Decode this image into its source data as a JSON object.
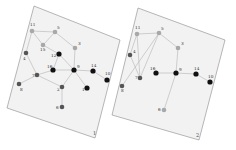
{
  "colors": {
    "black": "#111111",
    "dark": "#555555",
    "mid": "#777777",
    "light": "#a8a8a8"
  },
  "panels": [
    {
      "id": "panel-1",
      "label": "1",
      "corners": "34,6 120,40 95,138 7,108",
      "label_pos": [
        93,
        135
      ],
      "nodes": [
        {
          "id": "11",
          "x": 32,
          "y": 31,
          "shade": "light",
          "lx": 30,
          "ly": 26
        },
        {
          "id": "5",
          "x": 55,
          "y": 32,
          "shade": "light",
          "lx": 57,
          "ly": 29
        },
        {
          "id": "15",
          "x": 43,
          "y": 45,
          "shade": "light",
          "lx": 40,
          "ly": 51
        },
        {
          "id": "4",
          "x": 26,
          "y": 53,
          "shade": "dark",
          "lx": 23,
          "ly": 60
        },
        {
          "id": "3",
          "x": 75,
          "y": 48,
          "shade": "light",
          "lx": 78,
          "ly": 45
        },
        {
          "id": "12",
          "x": 59,
          "y": 54,
          "shade": "black",
          "lx": 51,
          "ly": 57
        },
        {
          "id": "16",
          "x": 53,
          "y": 70,
          "shade": "black",
          "lx": 47,
          "ly": 68
        },
        {
          "id": "9",
          "x": 74,
          "y": 70,
          "shade": "black",
          "lx": 77,
          "ly": 68
        },
        {
          "id": "14",
          "x": 93,
          "y": 71,
          "shade": "black",
          "lx": 91,
          "ly": 67
        },
        {
          "id": "10",
          "x": 107,
          "y": 80,
          "shade": "black",
          "lx": 105,
          "ly": 75
        },
        {
          "id": "7",
          "x": 37,
          "y": 75,
          "shade": "dark",
          "lx": 32,
          "ly": 77
        },
        {
          "id": "8",
          "x": 19,
          "y": 84,
          "shade": "dark",
          "lx": 20,
          "ly": 91
        },
        {
          "id": "2",
          "x": 62,
          "y": 87,
          "shade": "dark",
          "lx": 57,
          "ly": 91
        },
        {
          "id": "1",
          "x": 87,
          "y": 88,
          "shade": "black",
          "lx": 82,
          "ly": 91
        },
        {
          "id": "6",
          "x": 62,
          "y": 107,
          "shade": "dark",
          "lx": 56,
          "ly": 109
        }
      ],
      "edges": [
        [
          "11",
          "5"
        ],
        [
          "11",
          "15"
        ],
        [
          "5",
          "15"
        ],
        [
          "5",
          "3"
        ],
        [
          "11",
          "4"
        ],
        [
          "15",
          "12"
        ],
        [
          "3",
          "9"
        ],
        [
          "4",
          "7"
        ],
        [
          "12",
          "16"
        ],
        [
          "12",
          "9"
        ],
        [
          "16",
          "9"
        ],
        [
          "16",
          "7"
        ],
        [
          "9",
          "14"
        ],
        [
          "14",
          "10"
        ],
        [
          "9",
          "1"
        ],
        [
          "9",
          "2"
        ],
        [
          "7",
          "2"
        ],
        [
          "8",
          "7"
        ],
        [
          "2",
          "6"
        ]
      ]
    },
    {
      "id": "panel-2",
      "label": "2",
      "corners": "138,8 225,40 199,140 112,115",
      "label_pos": [
        196,
        137
      ],
      "nodes": [
        {
          "id": "11",
          "x": 137,
          "y": 34,
          "shade": "light",
          "lx": 135,
          "ly": 29
        },
        {
          "id": "5",
          "x": 159,
          "y": 33,
          "shade": "light",
          "lx": 161,
          "ly": 30
        },
        {
          "id": "4",
          "x": 130,
          "y": 55,
          "shade": "dark",
          "lx": 133,
          "ly": 53
        },
        {
          "id": "3",
          "x": 178,
          "y": 48,
          "shade": "light",
          "lx": 181,
          "ly": 45
        },
        {
          "id": "7",
          "x": 140,
          "y": 78,
          "shade": "dark",
          "lx": 135,
          "ly": 79
        },
        {
          "id": "8",
          "x": 122,
          "y": 86,
          "shade": "dark",
          "lx": 121,
          "ly": 92
        },
        {
          "id": "16",
          "x": 156,
          "y": 73,
          "shade": "black",
          "lx": 150,
          "ly": 70
        },
        {
          "id": "9",
          "x": 176,
          "y": 73,
          "shade": "black",
          "lx": 179,
          "ly": 71
        },
        {
          "id": "14",
          "x": 196,
          "y": 74,
          "shade": "black",
          "lx": 194,
          "ly": 70
        },
        {
          "id": "10",
          "x": 210,
          "y": 82,
          "shade": "black",
          "lx": 208,
          "ly": 78
        },
        {
          "id": "6",
          "x": 164,
          "y": 110,
          "shade": "light",
          "lx": 158,
          "ly": 111
        }
      ],
      "edges": [
        [
          "11",
          "5"
        ],
        [
          "5",
          "3"
        ],
        [
          "11",
          "4"
        ],
        [
          "11",
          "7"
        ],
        [
          "5",
          "7"
        ],
        [
          "5",
          "8"
        ],
        [
          "4",
          "7"
        ],
        [
          "3",
          "9"
        ],
        [
          "16",
          "9"
        ],
        [
          "9",
          "14"
        ],
        [
          "14",
          "10"
        ],
        [
          "9",
          "6"
        ]
      ]
    }
  ]
}
